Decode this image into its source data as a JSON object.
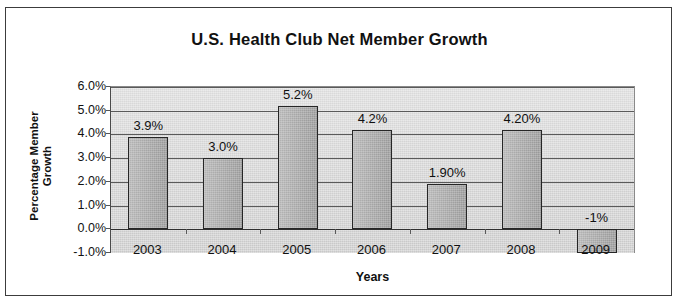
{
  "chart_data": {
    "type": "bar",
    "title": "U.S. Health Club Net Member Growth",
    "xlabel": "Years",
    "ylabel": "Percentage Member Growth",
    "ylabel_line1": "Percentage Member",
    "ylabel_line2": "Growth",
    "categories": [
      "2003",
      "2004",
      "2005",
      "2006",
      "2007",
      "2008",
      "2009"
    ],
    "values": [
      3.9,
      3.0,
      5.2,
      4.2,
      1.9,
      4.2,
      -1.0
    ],
    "data_labels": [
      "3.9%",
      "3.0%",
      "5.2%",
      "4.2%",
      "1.90%",
      "4.20%",
      "-1%"
    ],
    "ylim": [
      -1.0,
      6.0
    ],
    "ytick_values": [
      6.0,
      5.0,
      4.0,
      3.0,
      2.0,
      1.0,
      0.0,
      -1.0
    ],
    "ytick_labels": [
      "6.0%",
      "5.0%",
      "4.0%",
      "3.0%",
      "2.0%",
      "1.0%",
      "0.0%",
      "-1.0%"
    ],
    "grid": true,
    "legend": false,
    "bar_fill_color": "#a8a8a8",
    "bar_border_color": "#262626",
    "plot_background_color": "#d3d3d3",
    "figure_background_color": "#ffffff",
    "text_color": "#111111"
  }
}
